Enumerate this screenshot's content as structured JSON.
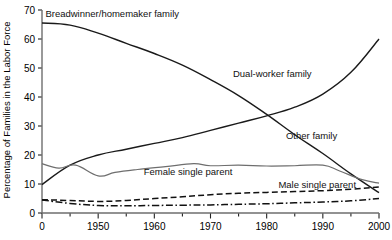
{
  "chart_data": {
    "type": "line",
    "title": "",
    "xlabel": "",
    "ylabel": "Percentage of Families in the Labor Force",
    "xlim": [
      1940,
      2000
    ],
    "ylim": [
      0,
      70
    ],
    "grid": false,
    "legend_position": "inline-annotations",
    "xticks": [
      1940,
      1950,
      1960,
      1970,
      1980,
      1990,
      2000
    ],
    "xtick_labels": [
      "0",
      "1950",
      "1960",
      "1970",
      "1980",
      "1990",
      "2000"
    ],
    "xminor_step": 5,
    "yticks": [
      0,
      10,
      20,
      30,
      40,
      50,
      60,
      70
    ],
    "ytick_labels": [
      "0",
      "10",
      "20",
      "30",
      "40",
      "50",
      "60",
      "70"
    ],
    "series": [
      {
        "name": "Breadwinner/homemaker family",
        "style": "solid",
        "color": "#1a1a1a",
        "width": 1.4,
        "label_x": 1952.5,
        "label_y": 67.5,
        "x": [
          1940,
          1945,
          1950,
          1955,
          1960,
          1965,
          1970,
          1975,
          1980,
          1985,
          1990,
          1995,
          2000
        ],
        "y": [
          65.5,
          64.8,
          62.0,
          58.5,
          55.0,
          51.0,
          46.0,
          40.5,
          34.0,
          27.0,
          20.5,
          13.5,
          7.0
        ]
      },
      {
        "name": "Dual-worker family",
        "style": "solid",
        "color": "#1a1a1a",
        "width": 1.4,
        "label_x": 1981,
        "label_y": 47.0,
        "x": [
          1940,
          1945,
          1950,
          1955,
          1960,
          1965,
          1970,
          1975,
          1980,
          1985,
          1990,
          1995,
          2000
        ],
        "y": [
          9.8,
          16.5,
          20.0,
          22.0,
          24.0,
          26.0,
          28.5,
          31.0,
          33.5,
          36.5,
          41.0,
          48.5,
          60.0
        ]
      },
      {
        "name": "Other family",
        "style": "solid",
        "color": "#6e6e6e",
        "width": 1.2,
        "label_x": 1988,
        "label_y": 25.5,
        "x": [
          1940,
          1943,
          1946,
          1950,
          1953,
          1957,
          1962,
          1967,
          1970,
          1975,
          1980,
          1985,
          1990,
          1993,
          1997,
          2000
        ],
        "y": [
          17.0,
          15.5,
          16.5,
          12.8,
          14.0,
          15.0,
          16.0,
          17.0,
          16.3,
          16.5,
          16.2,
          16.3,
          16.5,
          14.5,
          11.5,
          10.3
        ]
      },
      {
        "name": "Female single parent",
        "style": "dashed",
        "color": "#111111",
        "width": 1.5,
        "label_x": 1966,
        "label_y": 13.0,
        "x": [
          1940,
          1945,
          1950,
          1955,
          1960,
          1965,
          1970,
          1975,
          1980,
          1985,
          1990,
          1995,
          2000
        ],
        "y": [
          4.6,
          4.3,
          4.0,
          4.3,
          5.0,
          5.6,
          6.3,
          6.8,
          7.1,
          7.4,
          7.7,
          8.2,
          9.0
        ]
      },
      {
        "name": "Male single parent",
        "style": "dashdot",
        "color": "#111111",
        "width": 1.5,
        "label_x": 1989,
        "label_y": 8.5,
        "x": [
          1940,
          1945,
          1950,
          1955,
          1960,
          1965,
          1970,
          1975,
          1980,
          1985,
          1990,
          1995,
          2000
        ],
        "y": [
          4.5,
          3.3,
          2.6,
          2.5,
          2.6,
          2.7,
          2.8,
          3.0,
          3.2,
          3.5,
          3.8,
          4.2,
          5.0
        ]
      }
    ]
  }
}
